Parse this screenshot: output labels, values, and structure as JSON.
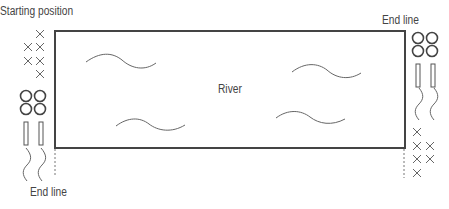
{
  "diagram": {
    "start_label": "Starting position",
    "end_label_left": "End line",
    "end_label_right": "End line",
    "river_label": "River",
    "colors": {
      "line": "#444444",
      "stroke": "#555555",
      "dotted": "#777777"
    },
    "left_group": {
      "x_markers": 6,
      "circles": 4,
      "rectangles": 2,
      "squiggles": 2
    },
    "right_group": {
      "circles": 4,
      "rectangles": 2,
      "squiggles": 2,
      "x_markers": 6
    },
    "river_waves": 4
  }
}
